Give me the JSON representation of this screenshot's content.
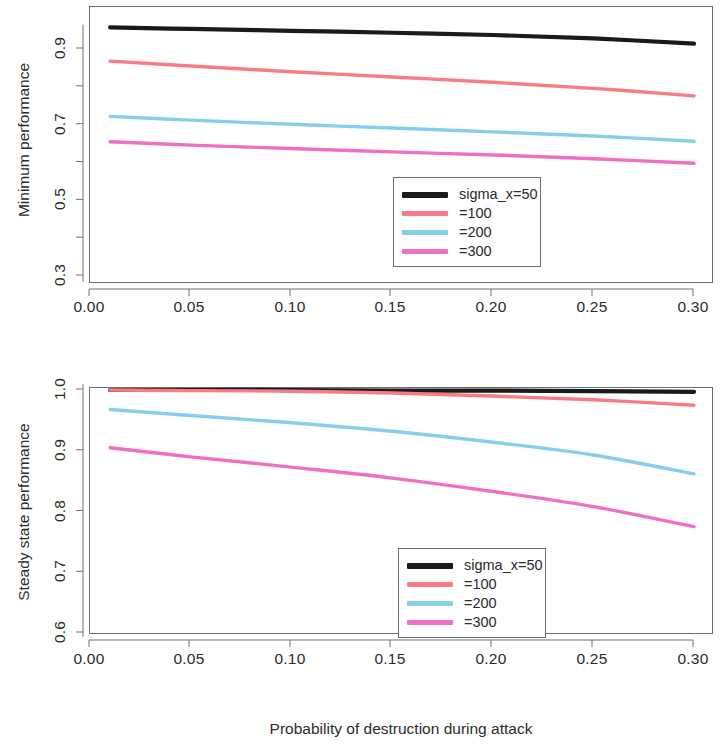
{
  "figure": {
    "xlabel": "Probability of destruction during attack"
  },
  "legend": {
    "entries": [
      {
        "label": "sigma_x=50",
        "color": "#1a1a1a"
      },
      {
        "label": "=100",
        "color": "#fa7b86"
      },
      {
        "label": "=200",
        "color": "#87ceeb"
      },
      {
        "label": "=300",
        "color": "#ee6fc4"
      }
    ]
  },
  "chart_data": [
    {
      "type": "line",
      "title": "",
      "xlabel": "Probability of destruction during attack",
      "ylabel": "Minimum performance",
      "xlim": [
        0.0,
        0.3
      ],
      "ylim": [
        0.282,
        0.962
      ],
      "xticks": [
        0.0,
        0.05,
        0.1,
        0.15,
        0.2,
        0.25,
        0.3
      ],
      "xtick_labels": [
        "0.00",
        "0.05",
        "0.10",
        "0.15",
        "0.20",
        "0.25",
        "0.30"
      ],
      "yticks": [
        0.3,
        0.5,
        0.7,
        0.9
      ],
      "ytick_labels": [
        "0.3",
        "0.5",
        "0.7",
        "0.9"
      ],
      "yticks_minor": [
        0.4,
        0.6,
        0.8
      ],
      "grid": false,
      "legend_position": "bottom-center-right",
      "x": [
        0.01,
        0.05,
        0.1,
        0.15,
        0.2,
        0.25,
        0.3
      ],
      "series": [
        {
          "name": "sigma_x=50",
          "color": "#1a1a1a",
          "values": [
            0.957,
            0.953,
            0.948,
            0.943,
            0.937,
            0.928,
            0.914
          ]
        },
        {
          "name": "=100",
          "color": "#fa7b86",
          "values": [
            0.868,
            0.855,
            0.84,
            0.826,
            0.812,
            0.796,
            0.776
          ]
        },
        {
          "name": "=200",
          "color": "#87ceeb",
          "values": [
            0.722,
            0.712,
            0.701,
            0.691,
            0.681,
            0.67,
            0.656
          ]
        },
        {
          "name": "=300",
          "color": "#ee6fc4",
          "values": [
            0.655,
            0.646,
            0.637,
            0.628,
            0.62,
            0.61,
            0.598
          ]
        }
      ]
    },
    {
      "type": "line",
      "title": "",
      "xlabel": "Probability of destruction during attack",
      "ylabel": "Steady state performance",
      "xlim": [
        0.0,
        0.3
      ],
      "ylim": [
        0.592,
        1.008
      ],
      "xticks": [
        0.0,
        0.05,
        0.1,
        0.15,
        0.2,
        0.25,
        0.3
      ],
      "xtick_labels": [
        "0.00",
        "0.05",
        "0.10",
        "0.15",
        "0.20",
        "0.25",
        "0.30"
      ],
      "yticks": [
        0.6,
        0.7,
        0.8,
        0.9,
        1.0
      ],
      "ytick_labels": [
        "0.6",
        "0.7",
        "0.8",
        "0.9",
        "1.0"
      ],
      "grid": false,
      "legend_position": "bottom-center-right",
      "x": [
        0.01,
        0.05,
        0.1,
        0.15,
        0.2,
        0.25,
        0.3
      ],
      "series": [
        {
          "name": "sigma_x=50",
          "color": "#1a1a1a",
          "values": [
            1.0,
            1.0,
            1.0,
            0.999,
            0.999,
            0.998,
            0.997
          ]
        },
        {
          "name": "=100",
          "color": "#fa7b86",
          "values": [
            1.0,
            0.999,
            0.998,
            0.995,
            0.99,
            0.984,
            0.975
          ]
        },
        {
          "name": "=200",
          "color": "#87ceeb",
          "values": [
            0.968,
            0.958,
            0.946,
            0.932,
            0.914,
            0.893,
            0.862
          ]
        },
        {
          "name": "=300",
          "color": "#ee6fc4",
          "values": [
            0.905,
            0.89,
            0.873,
            0.855,
            0.833,
            0.808,
            0.775
          ]
        }
      ]
    }
  ]
}
